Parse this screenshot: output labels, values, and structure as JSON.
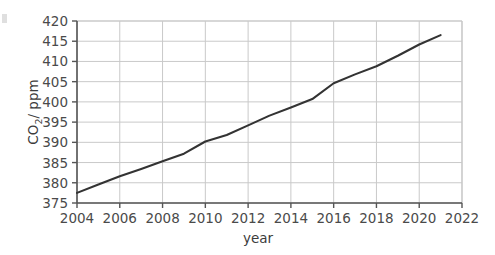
{
  "chart_data": {
    "type": "line",
    "title": "",
    "xlabel": "year",
    "ylabel": "CO2/ ppm",
    "ylabel_base": "CO",
    "ylabel_sub": "2",
    "ylabel_rest": "/ ppm",
    "xlim": [
      2004,
      2022
    ],
    "ylim": [
      375,
      420
    ],
    "grid": true,
    "legend": "none",
    "line_color": "#333333",
    "grid_color": "#c9c9c9",
    "axis_color": "#555555",
    "x_ticks": [
      2004,
      2006,
      2008,
      2010,
      2012,
      2014,
      2016,
      2018,
      2020,
      2022
    ],
    "y_ticks": [
      375,
      380,
      385,
      390,
      395,
      400,
      405,
      410,
      415,
      420
    ],
    "x_tick_labels": [
      "2004",
      "2006",
      "2008",
      "2010",
      "2012",
      "2014",
      "2016",
      "2018",
      "2020",
      "2022"
    ],
    "y_tick_labels": [
      "375",
      "380",
      "385",
      "390",
      "395",
      "400",
      "405",
      "410",
      "415",
      "420"
    ],
    "series": [
      {
        "name": "CO2 concentration",
        "x": [
          2004,
          2005,
          2006,
          2007,
          2008,
          2009,
          2010,
          2011,
          2012,
          2013,
          2014,
          2015,
          2016,
          2017,
          2018,
          2019,
          2020,
          2021
        ],
        "values": [
          377.5,
          379.6,
          381.6,
          383.4,
          385.3,
          387.2,
          390.2,
          391.8,
          394.2,
          396.6,
          398.6,
          400.7,
          404.6,
          406.8,
          408.8,
          411.4,
          414.2,
          416.5
        ]
      }
    ]
  }
}
